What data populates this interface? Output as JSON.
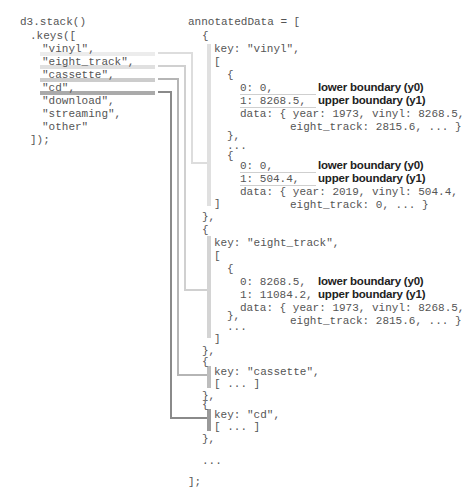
{
  "left_code": {
    "line1": "d3.stack()",
    "line2": ".keys([",
    "keys": [
      "\"vinyl\",",
      "\"eight_track\",",
      "\"cassette\",",
      "\"cd\",",
      "\"download\",",
      "\"streaming\",",
      "\"other\""
    ],
    "close": "]);"
  },
  "right_code": {
    "header": "annotatedData = [",
    "open_brace": "{",
    "vinyl": {
      "key_line": "key: \"vinyl\",",
      "open_bracket": "[",
      "item1": {
        "open": "{",
        "y0_line": "0: 0,",
        "y1_line": "1: 8268.5,",
        "data_line1": "data: { year: 1973, vinyl: 8268.5,",
        "data_line2": "eight_track: 2815.6, ... }",
        "close": "},"
      },
      "ellipsis": "...",
      "item2": {
        "open": "{",
        "y0_line": "0: 0,",
        "y1_line": "1: 504.4,",
        "data_line1": "data: { year: 2019, vinyl: 504.4,",
        "data_line2": "eight_track: 0, ... }",
        "close": "}"
      },
      "close_bracket": "]",
      "close_brace": "},",
      "next_open": "{"
    },
    "eight_track": {
      "key_line": "key: \"eight_track\",",
      "open_bracket": "[",
      "item1": {
        "open": "{",
        "y0_line": "0: 8268.5,",
        "y1_line": "1: 11084.2,",
        "data_line1": "data: { year: 1973, vinyl: 8268.5,",
        "data_line2": "eight_track: 2815.6, ... }",
        "close": "},"
      },
      "ellipsis": "...",
      "close_bracket": "]",
      "close_brace": "},",
      "next_open": "{"
    },
    "cassette": {
      "key_line": "key: \"cassette\",",
      "body": "[ ... ]",
      "close_brace": "},",
      "next_open": "{"
    },
    "cd": {
      "key_line": "key: \"cd\",",
      "body": "[ ... ]",
      "close_brace": "},"
    },
    "ellipsis": "...",
    "footer": "];"
  },
  "annotations": {
    "lower": "lower boundary (y0)",
    "upper": "upper boundary (y1)"
  },
  "colors": {
    "vinyl": "#e6e6e6",
    "eight_track": "#d4d4d4",
    "cassette": "#bdbdbd",
    "cd": "#9a9a9a",
    "text": "#555555",
    "annotation": "#222222"
  }
}
